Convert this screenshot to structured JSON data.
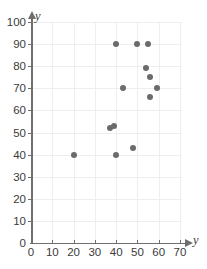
{
  "chart_data": {
    "type": "scatter",
    "title": "",
    "xlabel": "y",
    "ylabel": "y",
    "xlim": [
      0,
      70
    ],
    "ylim": [
      0,
      100
    ],
    "xticks": [
      0,
      10,
      20,
      30,
      40,
      50,
      60,
      70
    ],
    "yticks": [
      0,
      10,
      20,
      30,
      40,
      50,
      60,
      70,
      80,
      90,
      100
    ],
    "grid": true,
    "legend": false,
    "marker_color": "#6b6b6b",
    "axis_color": "#6f6f6f",
    "grid_color": "#edeef1",
    "points": [
      {
        "x": 20,
        "y": 40
      },
      {
        "x": 37,
        "y": 52
      },
      {
        "x": 39,
        "y": 53
      },
      {
        "x": 40,
        "y": 40
      },
      {
        "x": 40,
        "y": 90
      },
      {
        "x": 43,
        "y": 70
      },
      {
        "x": 48,
        "y": 43
      },
      {
        "x": 50,
        "y": 90
      },
      {
        "x": 54,
        "y": 79
      },
      {
        "x": 55,
        "y": 90
      },
      {
        "x": 56,
        "y": 75
      },
      {
        "x": 56,
        "y": 66
      },
      {
        "x": 59,
        "y": 70
      }
    ]
  },
  "axes": {
    "x_label": "y",
    "y_label": "y",
    "x_tick_labels": [
      "0",
      "10",
      "20",
      "30",
      "40",
      "50",
      "60",
      "70"
    ],
    "y_tick_labels": [
      "0",
      "10",
      "20",
      "30",
      "40",
      "50",
      "60",
      "70",
      "80",
      "90",
      "100"
    ]
  }
}
